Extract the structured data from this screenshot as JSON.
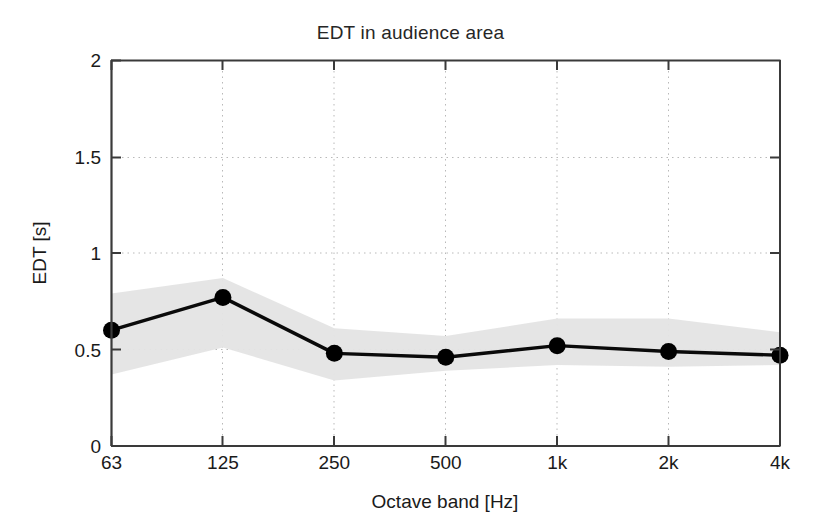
{
  "chart_data": {
    "type": "line",
    "title": "EDT in audience area",
    "xlabel": "Octave band [Hz]",
    "ylabel": "EDT [s]",
    "categories": [
      "63",
      "125",
      "250",
      "500",
      "1k",
      "2k",
      "4k"
    ],
    "values": [
      0.6,
      0.77,
      0.48,
      0.46,
      0.52,
      0.49,
      0.47
    ],
    "series": [
      {
        "name": "EDT mean",
        "values": [
          0.6,
          0.77,
          0.48,
          0.46,
          0.52,
          0.49,
          0.47
        ]
      },
      {
        "name": "spread band upper",
        "values": [
          0.79,
          0.87,
          0.61,
          0.57,
          0.66,
          0.66,
          0.59
        ]
      },
      {
        "name": "spread band lower",
        "values": [
          0.37,
          0.51,
          0.34,
          0.39,
          0.42,
          0.41,
          0.42
        ]
      }
    ],
    "ylim": [
      0,
      2
    ],
    "yticks": [
      "0",
      "0.5",
      "1",
      "1.5",
      "2"
    ],
    "ytick_values": [
      0,
      0.5,
      1,
      1.5,
      2
    ],
    "xticks": [
      "63",
      "125",
      "250",
      "500",
      "1k",
      "2k",
      "4k"
    ],
    "grid": true,
    "grid_style": "dotted",
    "legend": "none",
    "marker": "filled-circle",
    "line_color": "#000000",
    "band_color": "#e3e3e3",
    "axis_color": "#3a3a3a",
    "grid_color": "#b9b9b9"
  }
}
